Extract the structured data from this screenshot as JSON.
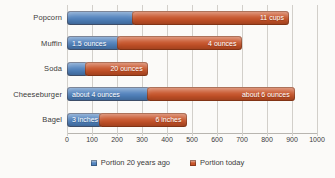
{
  "chart_data": {
    "type": "bar",
    "orientation": "horizontal",
    "stacked": true,
    "title": "",
    "categories": [
      "Popcorn",
      "Muffin",
      "Soda",
      "Cheeseburger",
      "Bagel"
    ],
    "series": [
      {
        "name": "Portion 20 years ago",
        "color": "#4F81BD",
        "values": [
          270,
          210,
          85,
          333,
          140
        ],
        "bar_labels": [
          "",
          "1.5 ounces",
          "",
          "about 4 ounces",
          "3 inches"
        ],
        "labels_align": "start"
      },
      {
        "name": "Portion today",
        "color": "#C85227",
        "values": [
          630,
          500,
          250,
          590,
          350
        ],
        "bar_labels": [
          "11 cups",
          "4 ounces",
          "20 ounces",
          "about 6 ounces",
          "6 inches"
        ],
        "labels_align": "end"
      }
    ],
    "xlim": [
      0,
      1000
    ],
    "xticks": [
      "0",
      "100",
      "200",
      "300",
      "400",
      "500",
      "600",
      "700",
      "800",
      "900",
      "1000"
    ],
    "grid": true,
    "legend_position": "bottom",
    "colors": {
      "background": "#FBFAF8",
      "gridline": "#D2CFCA",
      "axis_line": "#B8B5B0",
      "text": "#3B3B3B",
      "bar_label_text": "#FFFFFF"
    }
  }
}
